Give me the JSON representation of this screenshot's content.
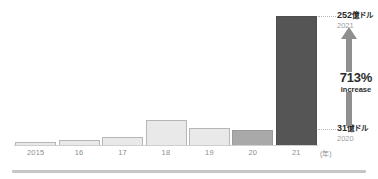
{
  "chart_data": {
    "type": "bar",
    "title": "",
    "xlabel": "(年)",
    "ylabel": "",
    "categories": [
      "2015",
      "16",
      "17",
      "18",
      "19",
      "20",
      "21"
    ],
    "values": [
      2,
      4,
      7,
      21,
      14,
      31,
      252
    ],
    "value_unit": "億ドル",
    "ylim": [
      0,
      252
    ],
    "grid": false,
    "legend": false,
    "series": [
      {
        "name": "金額(億ドル)",
        "values": [
          2,
          4,
          7,
          21,
          14,
          31,
          252
        ]
      }
    ],
    "bar_styles": [
      "light",
      "light",
      "light",
      "light",
      "light",
      "mid",
      "dark"
    ],
    "annotations": [
      {
        "id": "top",
        "value": "252",
        "unit": "億ドル",
        "year": "2021"
      },
      {
        "id": "bottom",
        "value": "31",
        "unit": "億ドル",
        "year": "2020"
      },
      {
        "id": "growth",
        "number": "713%",
        "word": "increase"
      }
    ]
  },
  "axis": {
    "ticks": [
      "2015",
      "16",
      "17",
      "18",
      "19",
      "20",
      "21"
    ],
    "unit_label": "(年)"
  },
  "callouts": {
    "top": {
      "value": "252",
      "unit": "億ドル",
      "year": "2021"
    },
    "bottom": {
      "value": "31",
      "unit": "億ドル",
      "year": "2020"
    },
    "growth": {
      "number": "713%",
      "word": "increase"
    }
  },
  "colors": {
    "bar_light": "#e9e9e9",
    "bar_light_border": "#b6b6b6",
    "bar_mid": "#a9a9a9",
    "bar_dark": "#555555",
    "arrow": "#8f8f8f",
    "tick_text": "#8d8d8d",
    "value_text": "#2b2b2b",
    "year_text": "#9c9c9c",
    "rule": "#c6c6c6"
  }
}
